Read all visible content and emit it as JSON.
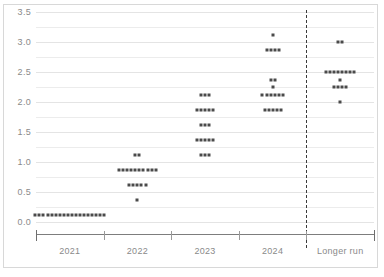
{
  "chart_data": {
    "type": "scatter",
    "title": "",
    "subtitle": "",
    "xlabel": "",
    "ylabel": "",
    "ylim": [
      0.0,
      3.5
    ],
    "grid": true,
    "legend": null,
    "categories": [
      "2021",
      "2022",
      "2023",
      "2024",
      "Longer run"
    ],
    "ytick_labels": [
      "0.0",
      "0.5",
      "1.0",
      "1.5",
      "2.0",
      "2.5",
      "3.0",
      "3.5"
    ],
    "ytick_values": [
      0.0,
      0.5,
      1.0,
      1.5,
      2.0,
      2.5,
      3.0,
      3.5
    ],
    "separator": {
      "after_category": "2024",
      "style": "dashed"
    },
    "series": [
      {
        "name": "2021",
        "rows": [
          {
            "value": 0.125,
            "count": 18
          }
        ]
      },
      {
        "name": "2022",
        "rows": [
          {
            "value": 0.375,
            "count": 1
          },
          {
            "value": 0.625,
            "count": 5
          },
          {
            "value": 0.875,
            "count": 10
          },
          {
            "value": 1.125,
            "count": 2
          }
        ]
      },
      {
        "name": "2023",
        "rows": [
          {
            "value": 1.125,
            "count": 3
          },
          {
            "value": 1.375,
            "count": 5
          },
          {
            "value": 1.625,
            "count": 3
          },
          {
            "value": 1.875,
            "count": 5
          },
          {
            "value": 2.125,
            "count": 3
          }
        ]
      },
      {
        "name": "2024",
        "rows": [
          {
            "value": 1.875,
            "count": 5
          },
          {
            "value": 2.125,
            "count": 6
          },
          {
            "value": 2.25,
            "count": 1
          },
          {
            "value": 2.375,
            "count": 2
          },
          {
            "value": 2.875,
            "count": 4
          },
          {
            "value": 3.125,
            "count": 1
          }
        ]
      },
      {
        "name": "Longer run",
        "rows": [
          {
            "value": 2.0,
            "count": 1
          },
          {
            "value": 2.25,
            "count": 4
          },
          {
            "value": 2.375,
            "count": 1
          },
          {
            "value": 2.5,
            "count": 8
          },
          {
            "value": 3.0,
            "count": 2
          }
        ]
      }
    ],
    "colors": {
      "dot": "#4a4a4a",
      "grid": "#ececec",
      "axis": "#7d7d7d",
      "tick_label": "#8a8a8a",
      "separator": "#3a3a3a",
      "background": "#ffffff",
      "frame": "#d8d8d8"
    }
  }
}
